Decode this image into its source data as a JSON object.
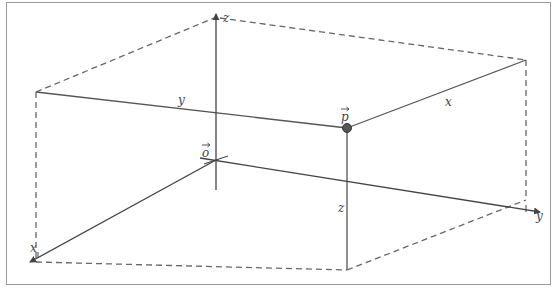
{
  "diagram": {
    "type": "3d-coordinate-box",
    "colors": {
      "line": "#555555",
      "dashed": "#666666",
      "point": "#555555",
      "frame": "#9a9a9a"
    },
    "axes": {
      "x": {
        "label": "x"
      },
      "y": {
        "label": "y"
      },
      "z": {
        "label": "z"
      }
    },
    "points": {
      "origin": {
        "label": "o",
        "vector": true
      },
      "p": {
        "label": "p",
        "vector": true
      }
    },
    "edge_labels": {
      "y_edge": "y",
      "x_edge": "x",
      "z_edge": "z"
    }
  }
}
